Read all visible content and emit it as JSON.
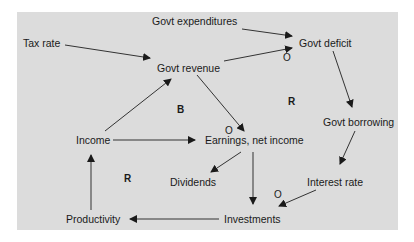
{
  "diagram": {
    "type": "causal-loop",
    "nodes": [
      {
        "id": "govt_expenditures",
        "label": "Govt expenditures"
      },
      {
        "id": "tax_rate",
        "label": "Tax rate"
      },
      {
        "id": "govt_deficit",
        "label": "Govt deficit"
      },
      {
        "id": "govt_revenue",
        "label": "Govt revenue"
      },
      {
        "id": "govt_borrowing",
        "label": "Govt borrowing"
      },
      {
        "id": "income",
        "label": "Income"
      },
      {
        "id": "earnings",
        "label": "Earnings, net income"
      },
      {
        "id": "dividends",
        "label": "Dividends"
      },
      {
        "id": "interest_rate",
        "label": "Interest rate"
      },
      {
        "id": "productivity",
        "label": "Productivity"
      },
      {
        "id": "investments",
        "label": "Investments"
      }
    ],
    "edges": [
      {
        "from": "govt_expenditures",
        "to": "govt_deficit",
        "polarity": ""
      },
      {
        "from": "tax_rate",
        "to": "govt_revenue",
        "polarity": ""
      },
      {
        "from": "govt_revenue",
        "to": "govt_deficit",
        "polarity": "O"
      },
      {
        "from": "govt_deficit",
        "to": "govt_borrowing",
        "polarity": ""
      },
      {
        "from": "govt_borrowing",
        "to": "interest_rate",
        "polarity": ""
      },
      {
        "from": "govt_revenue",
        "to": "earnings",
        "polarity": "O"
      },
      {
        "from": "income",
        "to": "govt_revenue",
        "polarity": ""
      },
      {
        "from": "income",
        "to": "earnings",
        "polarity": ""
      },
      {
        "from": "earnings",
        "to": "dividends",
        "polarity": ""
      },
      {
        "from": "earnings",
        "to": "investments",
        "polarity": ""
      },
      {
        "from": "interest_rate",
        "to": "investments",
        "polarity": "O"
      },
      {
        "from": "investments",
        "to": "productivity",
        "polarity": ""
      },
      {
        "from": "productivity",
        "to": "income",
        "polarity": ""
      }
    ],
    "loop_labels": [
      {
        "id": "loop_b",
        "label": "B"
      },
      {
        "id": "loop_r_top",
        "label": "R"
      },
      {
        "id": "loop_r_bottom",
        "label": "R"
      }
    ],
    "polarity_marks": [
      "O",
      "O",
      "O"
    ]
  },
  "colors": {
    "panel": "#dcdcdc",
    "ink": "#1a1a1a"
  }
}
